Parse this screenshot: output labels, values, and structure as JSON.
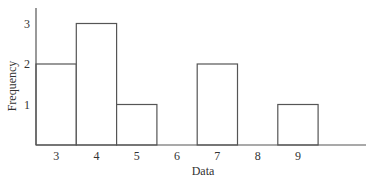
{
  "chart_data": {
    "type": "bar",
    "title": "",
    "xlabel": "Data",
    "ylabel": "Frequency",
    "categories": [
      "3",
      "4",
      "5",
      "6",
      "7",
      "8",
      "9"
    ],
    "values": [
      2,
      3,
      1,
      0,
      2,
      0,
      1
    ],
    "yticks": [
      "1",
      "2",
      "3"
    ],
    "ylim": [
      0,
      3.5
    ],
    "grid": false,
    "legend": null,
    "bar_style": {
      "fill": "#ffffff",
      "stroke": "#555555"
    }
  }
}
